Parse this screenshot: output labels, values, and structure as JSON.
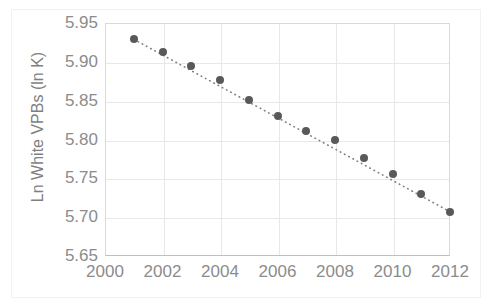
{
  "chart_data": {
    "type": "scatter",
    "title": "",
    "subtitle": "",
    "xlabel": "",
    "ylabel": "Ln White VPBs (ln K)",
    "x": [
      2001,
      2002,
      2003,
      2004,
      2005,
      2006,
      2007,
      2008,
      2009,
      2010,
      2011,
      2012
    ],
    "values": [
      5.929,
      5.913,
      5.894,
      5.876,
      5.851,
      5.83,
      5.811,
      5.8,
      5.776,
      5.755,
      5.73,
      5.707
    ],
    "series": [
      {
        "name": "Ln White VPBs",
        "values": [
          5.929,
          5.913,
          5.894,
          5.876,
          5.851,
          5.83,
          5.811,
          5.8,
          5.776,
          5.755,
          5.73,
          5.707
        ],
        "marker_color": "#595959",
        "marker_shape": "circle"
      }
    ],
    "trendline": {
      "style": "dotted",
      "color": "#7f7f7f",
      "from": {
        "x": 2001,
        "y": 5.929
      },
      "to": {
        "x": 2012,
        "y": 5.707
      }
    },
    "xlim": [
      2000,
      2012
    ],
    "ylim": [
      5.65,
      5.95
    ],
    "xticks": [
      "2000",
      "2002",
      "2004",
      "2006",
      "2008",
      "2010",
      "2012"
    ],
    "xtick_values": [
      2000,
      2002,
      2004,
      2006,
      2008,
      2010,
      2012
    ],
    "yticks": [
      "5.95",
      "5.90",
      "5.85",
      "5.80",
      "5.75",
      "5.70",
      "5.65"
    ],
    "ytick_values": [
      5.95,
      5.9,
      5.85,
      5.8,
      5.75,
      5.7,
      5.65
    ],
    "grid": true,
    "grid_color": "#e8e8e8",
    "legend": null,
    "legend_position": "none",
    "plot_background": "#ffffff",
    "axis_color": "#d9d9d9",
    "tick_label_color": "#8c8c8c"
  }
}
